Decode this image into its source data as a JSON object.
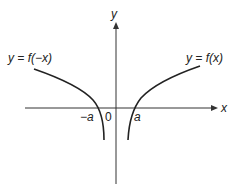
{
  "diagram": {
    "type": "function-graph",
    "axes": {
      "x_label": "x",
      "y_label": "y",
      "origin_label": "0"
    },
    "curves": [
      {
        "label": "y = f(−x)",
        "x_intercept_label": "−a",
        "side": "left"
      },
      {
        "label": "y = f(x)",
        "x_intercept_label": "a",
        "side": "right"
      }
    ],
    "colors": {
      "ink": "#222222",
      "background": "#ffffff"
    }
  }
}
